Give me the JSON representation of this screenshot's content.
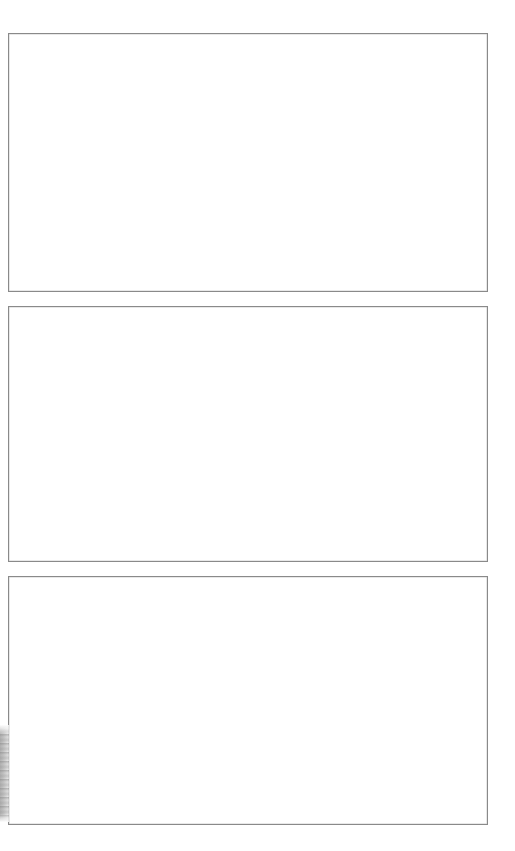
{
  "page": {
    "width": 515,
    "height": 851,
    "background_color": "#ffffff",
    "content_text": ""
  },
  "theme": {
    "panel_border_color": "#8a8a8a",
    "panel_fill_color": "#ffffff",
    "artifact_color": "#b4b4b4"
  },
  "panels": [
    {
      "id": "panel-1",
      "label": "",
      "caption": "",
      "content_text": "",
      "state": "empty",
      "x": 8,
      "y": 33,
      "width": 480,
      "height": 259
    },
    {
      "id": "panel-2",
      "label": "",
      "caption": "",
      "content_text": "",
      "state": "empty",
      "x": 8,
      "y": 306,
      "width": 480,
      "height": 256
    },
    {
      "id": "panel-3",
      "label": "",
      "caption": "",
      "content_text": "",
      "state": "empty",
      "x": 8,
      "y": 576,
      "width": 480,
      "height": 249
    }
  ],
  "artifacts": [
    {
      "id": "left-edge-smudge",
      "kind": "scan-artifact",
      "x": 0,
      "y": 725,
      "width": 9,
      "height": 97
    }
  ]
}
